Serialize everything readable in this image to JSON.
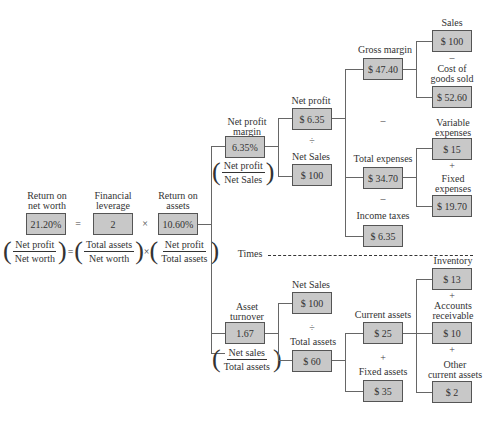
{
  "root": {
    "return_on_net_worth": {
      "label": "Return on net worth",
      "l1": "Return on",
      "l2": "net worth",
      "value": "21.20%"
    },
    "financial_leverage": {
      "l1": "Financial",
      "l2": "leverage",
      "value": "2"
    },
    "return_on_assets": {
      "l1": "Return on",
      "l2": "assets",
      "value": "10.60%"
    },
    "eq": "=",
    "times": "×",
    "formula": {
      "f1": {
        "num": "Net profit",
        "den": "Net worth"
      },
      "f2": {
        "num": "Total assets",
        "den": "Net worth"
      },
      "f3": {
        "num": "Net profit",
        "den": "Total assets"
      }
    }
  },
  "times_label": "Times",
  "net_profit_margin": {
    "l1": "Net profit",
    "l2": "margin",
    "value": "6.35%",
    "formula": {
      "num": "Net profit",
      "den": "Net Sales"
    }
  },
  "net_profit": {
    "label": "Net profit",
    "value": "$ 6.35"
  },
  "divide1": "÷",
  "net_sales_top": {
    "label": "Net Sales",
    "value": "$ 100"
  },
  "gross_margin": {
    "label": "Gross margin",
    "value": "$ 47.40"
  },
  "minus1": "–",
  "total_expenses": {
    "label": "Total expenses",
    "value": "$ 34.70"
  },
  "minus2": "–",
  "income_taxes": {
    "label": "Income taxes",
    "value": "$ 6.35"
  },
  "sales": {
    "label": "Sales",
    "value": "$ 100"
  },
  "minus3": "–",
  "cogs": {
    "l1": "Cost of",
    "l2": "goods sold",
    "value": "$ 52.60"
  },
  "variable_expenses": {
    "l1": "Variable",
    "l2": "expenses",
    "value": "$ 15"
  },
  "plus1": "+",
  "fixed_expenses": {
    "l1": "Fixed",
    "l2": "expenses",
    "value": "$ 19.70"
  },
  "asset_turnover": {
    "l1": "Asset",
    "l2": "turnover",
    "value": "1.67",
    "formula": {
      "num": "Net sales",
      "den": "Total assets"
    }
  },
  "net_sales_bottom": {
    "label": "Net Sales",
    "value": "$ 100"
  },
  "divide2": "÷",
  "total_assets": {
    "label": "Total assets",
    "value": "$ 60"
  },
  "current_assets": {
    "label": "Current assets",
    "value": "$ 25"
  },
  "plus2": "+",
  "fixed_assets": {
    "label": "Fixed assets",
    "value": "$ 35"
  },
  "inventory": {
    "label": "Inventory",
    "value": "$ 13"
  },
  "plus3": "+",
  "accounts_receivable": {
    "l1": "Accounts",
    "l2": "receivable",
    "value": "$ 10"
  },
  "plus4": "+",
  "other_current_assets": {
    "l1": "Other",
    "l2": "current assets",
    "value": "$ 2"
  }
}
